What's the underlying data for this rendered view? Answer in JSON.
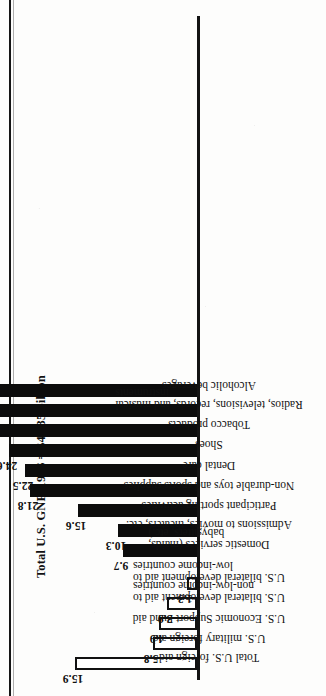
{
  "chart_data": {
    "type": "bar",
    "title": "Total U.S. GNP, 1986 = $4,235 billion",
    "xlabel": "",
    "ylabel": "",
    "ylim": [
      0,
      59.0
    ],
    "grid": false,
    "legend": "none",
    "units": "billions of dollars",
    "categories": [
      "Total U.S. foreign aid",
      "U.S. military foreign aid",
      "U.S. Economic Support Fund aid",
      "U.S. bilateral development aid to\nnon-low-income countries",
      "U.S. bilateral development aid to\nlow-income countries",
      "Domestic services (maids,\nbabysitters, etc.)",
      "Admissions to movies, theaters, etc.",
      "Participant sporting activities",
      "Non-durable toys and sports supplies",
      "Dental care",
      "Shoes",
      "Tobacco products",
      "Radios, televisions, records, and musical\ninstruments",
      "Alcoholic beverages"
    ],
    "values": [
      15.9,
      5.8,
      4.9,
      3.9,
      1.3,
      9.7,
      10.3,
      15.6,
      21.8,
      22.5,
      24.6,
      34.2,
      40.8,
      59.0
    ],
    "value_labels": [
      "15.9",
      "5.8",
      "4.9",
      "3.9",
      "1.3",
      "9.7",
      "10.3",
      "15.6",
      "21.8",
      "22.5",
      "24.6",
      "34.2",
      "40.8",
      "59.0"
    ],
    "bar_styles": [
      "hollow",
      "hollow",
      "hollow",
      "hollow",
      "hollow",
      "filled",
      "filled",
      "filled",
      "filled",
      "filled",
      "filled",
      "filled",
      "filled",
      "filled"
    ],
    "group_break_after_index": 4,
    "colors": {
      "filled": "#0c0c0c",
      "hollow_fill": "#ffffff",
      "outline": "#111111",
      "axis": "#131313",
      "text": "#111111",
      "page": "#fdfdfc"
    }
  }
}
